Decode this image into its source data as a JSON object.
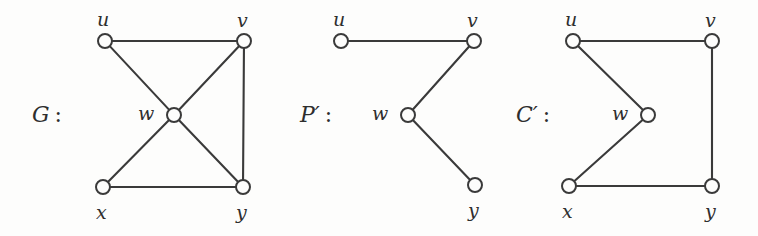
{
  "figure": {
    "background_color": "#fdfdfc",
    "stroke_color": "#3a3a3a",
    "width": 758,
    "height": 236,
    "caption": ""
  },
  "graphs": [
    {
      "id": "G",
      "name_label": "G",
      "prime": "",
      "colon": ":",
      "name_position": {
        "x": 32,
        "y": 104
      },
      "vertices": [
        {
          "id": "u",
          "label": "u",
          "cx": 105,
          "cy": 41,
          "r": 7,
          "label_x": 97,
          "label_y": 10
        },
        {
          "id": "v",
          "label": "v",
          "cx": 244,
          "cy": 41,
          "r": 7,
          "label_x": 237,
          "label_y": 11
        },
        {
          "id": "w",
          "label": "w",
          "cx": 174,
          "cy": 115,
          "r": 7,
          "label_x": 138,
          "label_y": 104
        },
        {
          "id": "x",
          "label": "x",
          "cx": 103,
          "cy": 187,
          "r": 7,
          "label_x": 96,
          "label_y": 203
        },
        {
          "id": "y",
          "label": "y",
          "cx": 243,
          "cy": 187,
          "r": 7,
          "label_x": 236,
          "label_y": 203
        }
      ],
      "edges": [
        {
          "from": "u",
          "to": "v"
        },
        {
          "from": "u",
          "to": "w"
        },
        {
          "from": "v",
          "to": "w"
        },
        {
          "from": "v",
          "to": "y"
        },
        {
          "from": "w",
          "to": "x"
        },
        {
          "from": "w",
          "to": "y"
        },
        {
          "from": "x",
          "to": "y"
        }
      ]
    },
    {
      "id": "Pprime",
      "name_label": "P",
      "prime": "′",
      "colon": ":",
      "name_position": {
        "x": 300,
        "y": 104
      },
      "vertices": [
        {
          "id": "u",
          "label": "u",
          "cx": 341,
          "cy": 41,
          "r": 7,
          "label_x": 333,
          "label_y": 10
        },
        {
          "id": "v",
          "label": "v",
          "cx": 474,
          "cy": 41,
          "r": 7,
          "label_x": 467,
          "label_y": 11
        },
        {
          "id": "w",
          "label": "w",
          "cx": 408,
          "cy": 115,
          "r": 7,
          "label_x": 372,
          "label_y": 104
        },
        {
          "id": "y",
          "label": "y",
          "cx": 475,
          "cy": 185,
          "r": 7,
          "label_x": 468,
          "label_y": 201
        }
      ],
      "edges": [
        {
          "from": "u",
          "to": "v"
        },
        {
          "from": "v",
          "to": "w"
        },
        {
          "from": "w",
          "to": "y"
        }
      ]
    },
    {
      "id": "Cprime",
      "name_label": "C",
      "prime": "′",
      "colon": ":",
      "name_position": {
        "x": 516,
        "y": 104
      },
      "vertices": [
        {
          "id": "u",
          "label": "u",
          "cx": 573,
          "cy": 41,
          "r": 7,
          "label_x": 565,
          "label_y": 10
        },
        {
          "id": "v",
          "label": "v",
          "cx": 712,
          "cy": 41,
          "r": 7,
          "label_x": 705,
          "label_y": 11
        },
        {
          "id": "w",
          "label": "w",
          "cx": 648,
          "cy": 115,
          "r": 7,
          "label_x": 612,
          "label_y": 104
        },
        {
          "id": "x",
          "label": "x",
          "cx": 569,
          "cy": 186,
          "r": 7,
          "label_x": 562,
          "label_y": 202
        },
        {
          "id": "y",
          "label": "y",
          "cx": 712,
          "cy": 186,
          "r": 7,
          "label_x": 705,
          "label_y": 202
        }
      ],
      "edges": [
        {
          "from": "u",
          "to": "v"
        },
        {
          "from": "u",
          "to": "w"
        },
        {
          "from": "w",
          "to": "x"
        },
        {
          "from": "x",
          "to": "y"
        },
        {
          "from": "y",
          "to": "v"
        }
      ]
    }
  ]
}
